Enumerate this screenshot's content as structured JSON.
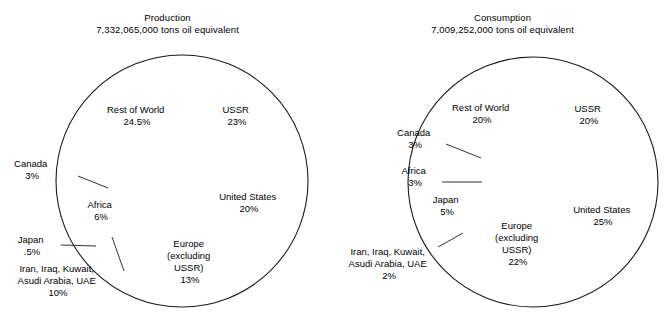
{
  "page": {
    "width": 670,
    "height": 326,
    "background": "#ffffff",
    "line_color": "#1a1a1a",
    "slice_color": "#555555"
  },
  "chart_data": [
    {
      "type": "pie",
      "id": "production",
      "title": "Production",
      "subtitle": "7,332,065,000 tons oil equivalent",
      "total_label": "7,332,065,000 tons oil equivalent",
      "units": "tons oil equivalent",
      "total_value": 7332065000,
      "start_angle_deg": 0,
      "direction": "clockwise",
      "center": {
        "x": 182,
        "y": 181
      },
      "radius": 126,
      "categories": [
        "USSR",
        "United States",
        "Europe (excluding USSR)",
        "Iran, Iraq, Kuwait, Asudi Arabia, UAE",
        "Japan",
        "Africa",
        "Canada",
        "Rest of World"
      ],
      "values": [
        23,
        20,
        13,
        10,
        0.5,
        6,
        3,
        24.5
      ],
      "slices": [
        {
          "name": "USSR",
          "label": "USSR",
          "percent_text": "23%",
          "value": 23,
          "label_placement": "inside"
        },
        {
          "name": "United States",
          "label": "United States",
          "percent_text": "20%",
          "value": 20,
          "label_placement": "inside"
        },
        {
          "name": "Europe (excluding USSR)",
          "label_lines": [
            "Europe",
            "(excluding",
            "USSR)"
          ],
          "percent_text": "13%",
          "value": 13,
          "label_placement": "inside"
        },
        {
          "name": "Iran, Iraq, Kuwait, Asudi Arabia, UAE",
          "label_lines": [
            "Iran, Iraq, Kuwait,",
            "Asudi Arabia, UAE"
          ],
          "percent_text": "10%",
          "value": 10,
          "label_placement": "outside"
        },
        {
          "name": "Japan",
          "label": "Japan",
          "percent_text": ".5%",
          "value": 0.5,
          "label_placement": "outside"
        },
        {
          "name": "Africa",
          "label": "Africa",
          "percent_text": "6%",
          "value": 6,
          "label_placement": "inside"
        },
        {
          "name": "Canada",
          "label": "Canada",
          "percent_text": "3%",
          "value": 3,
          "label_placement": "outside"
        },
        {
          "name": "Rest of World",
          "label": "Rest of World",
          "percent_text": "24.5%",
          "value": 24.5,
          "label_placement": "inside"
        }
      ]
    },
    {
      "type": "pie",
      "id": "consumption",
      "title": "Consumption",
      "subtitle": "7,009,252,000 tons oil equivalent",
      "total_label": "7,009,252,000 tons oil equivalent",
      "units": "tons oil equivalent",
      "total_value": 7009252000,
      "start_angle_deg": 0,
      "direction": "clockwise",
      "center": {
        "x": 198,
        "y": 182
      },
      "radius": 125,
      "categories": [
        "USSR",
        "United States",
        "Europe (excluding USSR)",
        "Iran, Iraq, Kuwait, Asudi Arabia, UAE",
        "Japan",
        "Africa",
        "Canada",
        "Rest of World"
      ],
      "values": [
        20,
        25,
        22,
        2,
        5,
        3,
        3,
        20
      ],
      "slices": [
        {
          "name": "USSR",
          "label": "USSR",
          "percent_text": "20%",
          "value": 20,
          "label_placement": "inside"
        },
        {
          "name": "United States",
          "label": "United States",
          "percent_text": "25%",
          "value": 25,
          "label_placement": "inside"
        },
        {
          "name": "Europe (excluding USSR)",
          "label_lines": [
            "Europe",
            "(excluding",
            "USSR)"
          ],
          "percent_text": "22%",
          "value": 22,
          "label_placement": "inside"
        },
        {
          "name": "Iran, Iraq, Kuwait, Asudi Arabia, UAE",
          "label_lines": [
            "Iran, Iraq, Kuwait,",
            "Asudi Arabia, UAE"
          ],
          "percent_text": "2%",
          "value": 2,
          "label_placement": "outside"
        },
        {
          "name": "Japan",
          "label": "Japan",
          "percent_text": "5%",
          "value": 5,
          "label_placement": "inside"
        },
        {
          "name": "Africa",
          "label": "Africa",
          "percent_text": "3%",
          "value": 3,
          "label_placement": "outside"
        },
        {
          "name": "Canada",
          "label": "Canada",
          "percent_text": "3%",
          "value": 3,
          "label_placement": "outside"
        },
        {
          "name": "Rest of World",
          "label": "Rest of World",
          "percent_text": "20%",
          "value": 20,
          "label_placement": "inside"
        }
      ]
    }
  ],
  "labels": {
    "production": {
      "ussr": {
        "line1": "USSR",
        "line2": "23%",
        "x": 237,
        "y": 113
      },
      "united_states": {
        "line1": "United States",
        "line2": "20%",
        "x": 249,
        "y": 200
      },
      "europe": {
        "line1": "Europe",
        "line2": "(excluding",
        "line3": "USSR)",
        "line4": "13%",
        "x": 190,
        "y": 247
      },
      "iran": {
        "line1": "Iran, Iraq, Kuwait,",
        "line2": "Asudi Arabia, UAE",
        "line3": "10%",
        "x": 58,
        "y": 272
      },
      "japan": {
        "line1": "Japan",
        "line2": ".5%",
        "x": 32,
        "y": 243
      },
      "africa": {
        "line1": "Africa",
        "line2": "6%",
        "x": 101,
        "y": 208
      },
      "canada": {
        "line1": "Canada",
        "line2": "3%",
        "x": 32,
        "y": 167
      },
      "rest_of_world": {
        "line1": "Rest of World",
        "line2": "24.5%",
        "x": 137,
        "y": 113
      }
    },
    "consumption": {
      "ussr": {
        "line1": "USSR",
        "line2": "20%",
        "x": 254,
        "y": 112
      },
      "united_states": {
        "line1": "United States",
        "line2": "25%",
        "x": 268,
        "y": 213
      },
      "europe": {
        "line1": "Europe",
        "line2": "(excluding",
        "line3": "USSR)",
        "line4": "22%",
        "x": 183,
        "y": 229
      },
      "iran": {
        "line1": "Iran, Iraq, Kuwait,",
        "line2": "Asudi Arabia, UAE",
        "line3": "2%",
        "x": 54,
        "y": 255
      },
      "japan": {
        "line1": "Japan",
        "line2": "5%",
        "x": 112,
        "y": 203
      },
      "africa": {
        "line1": "Africa",
        "line2": "3%",
        "x": 80,
        "y": 174
      },
      "canada": {
        "line1": "Canada",
        "line2": "3%",
        "x": 80,
        "y": 136
      },
      "rest_of_world": {
        "line1": "Rest of World",
        "line2": "20%",
        "x": 147,
        "y": 111
      }
    }
  }
}
